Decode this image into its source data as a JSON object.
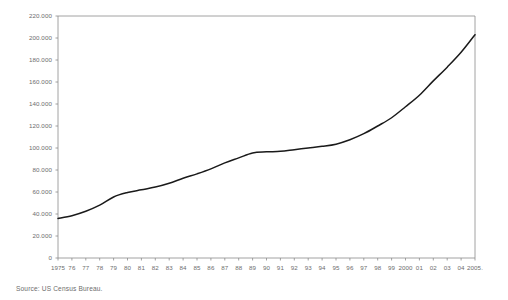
{
  "chart_data": {
    "type": "line",
    "title": "",
    "subtitle": "",
    "xlabel": "",
    "ylabel": "",
    "grid": false,
    "legend": "none",
    "source_note": "Source: US Census Bureau.",
    "ylim": [
      0,
      220000
    ],
    "ytick_step": 20000,
    "ytick_labels": [
      "220.000",
      "200.000",
      "180.000",
      "160.000",
      "140.000",
      "120.000",
      "100.000",
      "80.000",
      "60.000",
      "40.000",
      "20.000",
      "0"
    ],
    "ytick_values": [
      220000,
      200000,
      180000,
      160000,
      140000,
      120000,
      100000,
      80000,
      60000,
      40000,
      20000,
      0
    ],
    "xlim": [
      1975,
      2005
    ],
    "categories": [
      1975,
      1976,
      1977,
      1978,
      1979,
      1980,
      1981,
      1982,
      1983,
      1984,
      1985,
      1986,
      1987,
      1988,
      1989,
      1990,
      1991,
      1992,
      1993,
      1994,
      1995,
      1996,
      1997,
      1998,
      1999,
      2000,
      2001,
      2002,
      2003,
      2004,
      2005
    ],
    "xtick_labels": [
      "1975",
      "76",
      "77",
      "78",
      "79",
      "80",
      "81",
      "82",
      "83",
      "84",
      "85",
      "86",
      "87",
      "88",
      "89",
      "90",
      "91",
      "92",
      "93",
      "94",
      "95",
      "96",
      "97",
      "98",
      "99",
      "2000",
      "01",
      "02",
      "03",
      "04",
      "2005."
    ],
    "series": [
      {
        "name": "value",
        "color": "#1a1a1a",
        "values": [
          36000,
          38500,
          42500,
          48000,
          55500,
          59500,
          62000,
          64500,
          68000,
          72500,
          76500,
          81000,
          86500,
          91000,
          95500,
          96500,
          97000,
          98500,
          100000,
          101500,
          103500,
          107500,
          113000,
          120000,
          127500,
          137500,
          148000,
          161000,
          173500,
          187000,
          203000
        ]
      }
    ],
    "plot_area": {
      "left": 58,
      "top": 16,
      "right": 475,
      "bottom": 258
    },
    "axis_color": "#8a8a8a",
    "line_color": "#1a1a1a",
    "background": "#ffffff"
  }
}
